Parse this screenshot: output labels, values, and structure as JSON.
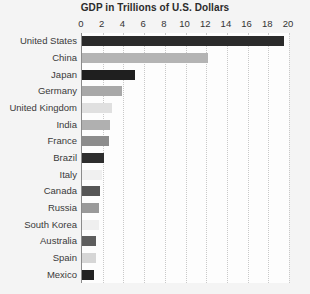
{
  "chart_data": {
    "type": "bar",
    "orientation": "horizontal",
    "title": "GDP in Trillions of U.S. Dollars",
    "xlabel": "",
    "ylabel": "",
    "xlim": [
      0,
      20
    ],
    "xticks": [
      0,
      2,
      4,
      6,
      8,
      10,
      12,
      14,
      16,
      18,
      20
    ],
    "xtick_labels": [
      "0",
      "2",
      "4",
      "6",
      "8",
      "10",
      "12",
      "14",
      "16",
      "18",
      "20"
    ],
    "grid": true,
    "grid_axis": "x",
    "grid_style": "dotted",
    "legend": false,
    "categories": [
      "United States",
      "China",
      "Japan",
      "Germany",
      "United Kingdom",
      "India",
      "France",
      "Brazil",
      "Italy",
      "Canada",
      "Russia",
      "South Korea",
      "Australia",
      "Spain",
      "Mexico"
    ],
    "values": [
      19.5,
      12.2,
      5.1,
      3.9,
      2.9,
      2.7,
      2.6,
      2.1,
      1.9,
      1.7,
      1.6,
      1.6,
      1.4,
      1.4,
      1.2
    ],
    "bar_colors": [
      "#2b2b2b",
      "#b4b4b4",
      "#1f1f1f",
      "#a8a8a8",
      "#e0e0e0",
      "#b0b0b0",
      "#8c8c8c",
      "#2e2e2e",
      "#f0f0f0",
      "#565656",
      "#9a9a9a",
      "#efefef",
      "#5e5e5e",
      "#d6d6d6",
      "#222222"
    ]
  },
  "style": {
    "page_background": "#f4f4f4",
    "plot_background": "#fdfdfd",
    "axis_color": "#8a8a8a",
    "grid_color": "#c9c9c9",
    "title_color": "#2b2b2b",
    "label_color": "#3a3a3a"
  }
}
